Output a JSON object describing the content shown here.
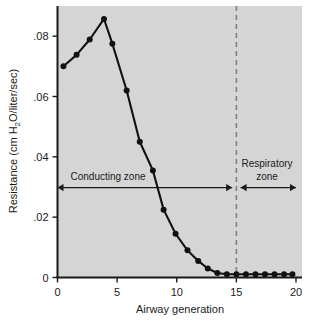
{
  "chart_data": {
    "type": "line",
    "title": "",
    "xlabel": "Airway generation",
    "ylabel": "Resistance (cm H2O/liter/sec)",
    "ylabel_parts": {
      "prefix": "Resistance (cm H",
      "subscript": "2",
      "suffix": "O/liter/sec)"
    },
    "xlim": [
      0,
      20
    ],
    "ylim": [
      0,
      0.09
    ],
    "grid": false,
    "legend": null,
    "background": "#d5d5d5",
    "line_color": "#111111",
    "marker": "circle",
    "xticks": [
      0,
      5,
      10,
      15,
      20
    ],
    "xticklabels": [
      "0",
      "5",
      "10",
      "15",
      "20"
    ],
    "yticks": [
      0,
      0.02,
      0.04,
      0.06,
      0.08
    ],
    "yticklabels": [
      "0",
      ".02",
      ".04",
      ".06",
      ".08"
    ],
    "x": [
      0.5,
      1.6,
      2.7,
      3.9,
      4.6,
      5.8,
      6.9,
      8.0,
      8.9,
      9.9,
      10.9,
      11.8,
      12.6,
      13.4,
      14.2,
      15.0,
      15.8,
      16.6,
      17.4,
      18.2,
      19.0,
      19.7
    ],
    "values": [
      0.07,
      0.0738,
      0.0789,
      0.0857,
      0.0775,
      0.062,
      0.045,
      0.0355,
      0.0225,
      0.0145,
      0.009,
      0.0055,
      0.003,
      0.0015,
      0.0011,
      0.0011,
      0.0011,
      0.0011,
      0.0011,
      0.0011,
      0.0011,
      0.0011
    ],
    "annotations": [
      {
        "name": "conducting-zone",
        "label": "Conducting zone",
        "x_start": 0.0,
        "x_end": 14.65,
        "y": 0.0298,
        "style": "double-arrow"
      },
      {
        "name": "respiratory-zone",
        "label_line1": "Respiratory",
        "label_line2": "zone",
        "x_start": 15.35,
        "x_end": 20.0,
        "y": 0.0298,
        "style": "double-arrow"
      },
      {
        "name": "zone-divider",
        "label": "",
        "x": 15.0,
        "style": "dashed-vertical",
        "color": "#808080"
      }
    ]
  }
}
